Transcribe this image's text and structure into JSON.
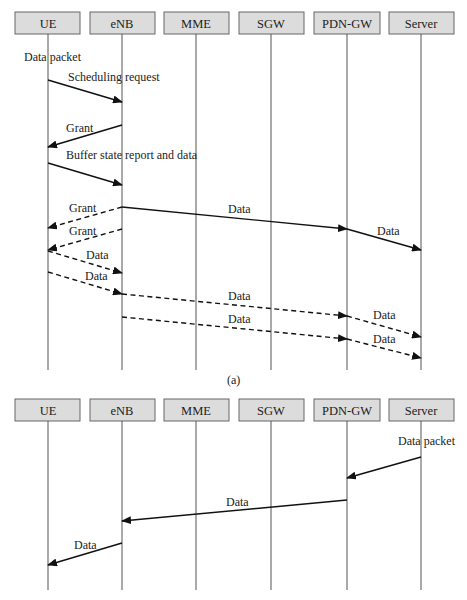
{
  "diagram_a": {
    "caption": "(a)",
    "participants": [
      "UE",
      "eNB",
      "MME",
      "SGW",
      "PDN-GW",
      "Server"
    ],
    "messages": [
      {
        "label": "Data packet",
        "type": "note",
        "at": "UE"
      },
      {
        "label": "Scheduling request",
        "from": "UE",
        "to": "eNB",
        "style": "solid"
      },
      {
        "label": "Grant",
        "from": "eNB",
        "to": "UE",
        "style": "solid"
      },
      {
        "label": "Buffer state report and data",
        "from": "UE",
        "to": "eNB",
        "style": "solid"
      },
      {
        "label": "Data",
        "from": "eNB",
        "to": "PDN-GW",
        "style": "solid"
      },
      {
        "label": "Data",
        "from": "PDN-GW",
        "to": "Server",
        "style": "solid"
      },
      {
        "label": "Grant",
        "from": "eNB",
        "to": "UE",
        "style": "dashed"
      },
      {
        "label": "Grant",
        "from": "eNB",
        "to": "UE",
        "style": "dashed"
      },
      {
        "label": "Data",
        "from": "UE",
        "to": "eNB",
        "style": "dashed"
      },
      {
        "label": "Data",
        "from": "UE",
        "to": "eNB",
        "style": "dashed"
      },
      {
        "label": "Data",
        "from": "eNB",
        "to": "PDN-GW",
        "style": "dashed"
      },
      {
        "label": "Data",
        "from": "PDN-GW",
        "to": "Server",
        "style": "dashed"
      },
      {
        "label": "Data",
        "from": "eNB",
        "to": "PDN-GW",
        "style": "dashed"
      },
      {
        "label": "Data",
        "from": "PDN-GW",
        "to": "Server",
        "style": "dashed"
      }
    ]
  },
  "diagram_b": {
    "participants": [
      "UE",
      "eNB",
      "MME",
      "SGW",
      "PDN-GW",
      "Server"
    ],
    "messages": [
      {
        "label": "Data packet",
        "type": "note",
        "at": "Server"
      },
      {
        "label": "",
        "from": "Server",
        "to": "PDN-GW",
        "style": "solid"
      },
      {
        "label": "Data",
        "from": "PDN-GW",
        "to": "eNB",
        "style": "solid"
      },
      {
        "label": "Data",
        "from": "eNB",
        "to": "UE",
        "style": "solid"
      }
    ]
  }
}
